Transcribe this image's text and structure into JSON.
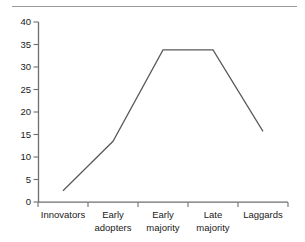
{
  "chart_data": {
    "type": "line",
    "title": "",
    "xlabel": "",
    "ylabel": "",
    "categories": [
      "Innovators",
      "Early adopters",
      "Early majority",
      "Late majority",
      "Laggards"
    ],
    "category_lines": [
      [
        "Innovators"
      ],
      [
        "Early",
        "adopters"
      ],
      [
        "Early",
        "majority"
      ],
      [
        "Late",
        "majority"
      ],
      [
        "Laggards"
      ]
    ],
    "values": [
      2.5,
      13.5,
      33.8,
      33.8,
      15.7
    ],
    "series": [
      {
        "name": "Adopter distribution",
        "values": [
          2.5,
          13.5,
          33.8,
          33.8,
          15.7
        ]
      }
    ],
    "ylim": [
      0,
      40
    ],
    "yticks": [
      0,
      5,
      10,
      15,
      20,
      25,
      30,
      35,
      40
    ],
    "ytick_labels": [
      "0",
      "5",
      "10",
      "15",
      "20",
      "25",
      "30",
      "35",
      "40"
    ],
    "grid": false,
    "legend": "none",
    "line_color": "#595959",
    "axis_color": "#6e6e6e",
    "rule_color": "#9a9a9a"
  }
}
